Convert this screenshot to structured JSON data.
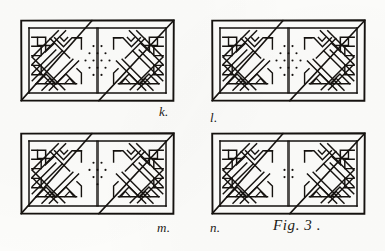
{
  "plate": {
    "background_color": "#fcfcfa",
    "ink_color": "#15120f",
    "caption": "Fig. 3 .",
    "medium": "engraved-line-plate",
    "subject": "four rectangular interlace key-pattern panels"
  },
  "panels": [
    {
      "id": "panel-k",
      "label": "k.",
      "label_position": "bottom-right",
      "x": 20,
      "y": 19,
      "w": 155,
      "h": 83,
      "border": true,
      "inner_inset": 9,
      "dot_rows": [
        2,
        3,
        4,
        3,
        2
      ],
      "dot_count": 14,
      "motif": "double-loop interlace, mirrored halves, central lozenge of dots"
    },
    {
      "id": "panel-l",
      "label": "l.",
      "label_position": "bottom-left",
      "x": 211,
      "y": 19,
      "w": 155,
      "h": 83,
      "border": true,
      "inner_inset": 9,
      "dot_rows": [
        2,
        3,
        4,
        3,
        2
      ],
      "dot_count": 14,
      "motif": "double-loop interlace, mirrored halves, central lozenge of dots"
    },
    {
      "id": "panel-m",
      "label": "m.",
      "label_position": "bottom-right",
      "x": 20,
      "y": 132,
      "w": 155,
      "h": 83,
      "border": true,
      "inner_inset": 9,
      "dot_rows": [
        2,
        3,
        2,
        1
      ],
      "dot_count": 8,
      "motif": "double-loop interlace, mirrored halves, central lozenge of dots"
    },
    {
      "id": "panel-n",
      "label": "n.",
      "label_position": "bottom-left",
      "x": 211,
      "y": 132,
      "w": 155,
      "h": 83,
      "border": true,
      "inner_inset": 9,
      "dot_rows": [
        2,
        2
      ],
      "dot_count": 4,
      "motif": "double-loop interlace, mirrored halves, small central dot cluster"
    }
  ],
  "labels": {
    "k": "k.",
    "l": "l.",
    "m": "m.",
    "n": "n."
  },
  "caption": {
    "text": "Fig. 3 ."
  }
}
